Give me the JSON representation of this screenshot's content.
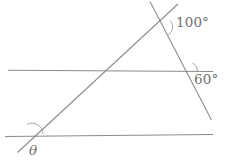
{
  "figure": {
    "kind": "geometry-diagram",
    "width": 225,
    "height": 165,
    "background_color": "#ffffff",
    "line_color": "#8a8a8a",
    "arc_color": "#9a9a9a",
    "text_color": "#6f6f6f",
    "lines": [
      {
        "name": "upper-horizontal-line",
        "x1": 8,
        "y1": 70.2,
        "x2": 213,
        "y2": 71.4
      },
      {
        "name": "lower-horizontal-line",
        "x1": 5,
        "y1": 136.4,
        "x2": 213,
        "y2": 134.6
      },
      {
        "name": "rising-transversal-line",
        "x1": 17.5,
        "y1": 152.5,
        "x2": 178,
        "y2": 4
      },
      {
        "name": "falling-transversal-line",
        "x1": 150,
        "y1": 1.5,
        "x2": 211.5,
        "y2": 120
      }
    ],
    "arcs": [
      {
        "name": "arc-100-degrees",
        "cx": 163.2,
        "cy": 27.0,
        "r": 9.5,
        "start_deg": -58,
        "end_deg": 42
      },
      {
        "name": "arc-60-degrees",
        "cx": 188.3,
        "cy": 71.0,
        "r": 9.0,
        "start_deg": 0,
        "end_deg": 62
      },
      {
        "name": "arc-theta",
        "cx": 32.0,
        "cy": 134.2,
        "r": 11.0,
        "start_deg": 0,
        "end_deg": 117
      }
    ],
    "labels": [
      {
        "name": "angle-label-100",
        "text": "100°",
        "x": 176,
        "y": 16
      },
      {
        "name": "angle-label-60",
        "text": "60°",
        "x": 194,
        "y": 73
      },
      {
        "name": "angle-label-theta",
        "text": "θ",
        "x": 29,
        "y": 144
      }
    ]
  },
  "chart_data": {
    "type": "diagram",
    "title": "",
    "annotations": [
      "100°",
      "60°",
      "θ"
    ],
    "values": [
      100,
      60,
      null
    ],
    "labels": [
      "100°",
      "60°",
      "θ"
    ]
  }
}
